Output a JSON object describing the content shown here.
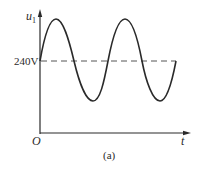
{
  "figure": {
    "caption": "(a)",
    "colors": {
      "ink": "#2a2a2a",
      "dash": "#555555",
      "background": "#ffffff"
    }
  },
  "axes": {
    "y_label": "u",
    "y_label_subscript": "1",
    "x_label": "t",
    "origin_label": "O",
    "dc_level_label": "240V"
  },
  "waveform": {
    "type": "sinusoid",
    "description": "sine wave offset by DC level 240V",
    "dc_offset": "240V",
    "cycles_shown": 2,
    "starts_at": "dc level, rising",
    "ends_at": "dc level, rising"
  }
}
